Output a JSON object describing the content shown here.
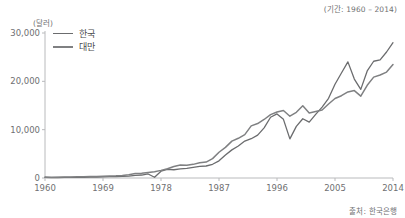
{
  "annotations": {
    "period": "(기간: 1960 – 2014)",
    "source": "출처: 한국은행",
    "unit": "(달러)"
  },
  "legend": {
    "items": [
      {
        "label": "한국",
        "color": "#6b6c6e"
      },
      {
        "label": "대만",
        "color": "#7f8082"
      }
    ]
  },
  "axis": {
    "y_ticks": [
      "0",
      "10,000",
      "20,000",
      "30,000"
    ],
    "x_ticks": [
      "1960",
      "1969",
      "1978",
      "1987",
      "1996",
      "2005",
      "2014"
    ]
  },
  "chart_data": {
    "type": "line",
    "title": "",
    "subtitle": "",
    "xlabel": "",
    "ylabel": "(달러)",
    "xlim": [
      1960,
      2014
    ],
    "ylim": [
      0,
      30000
    ],
    "grid": false,
    "legend_position": "top-left",
    "x": [
      1960,
      1961,
      1962,
      1963,
      1964,
      1965,
      1966,
      1967,
      1968,
      1969,
      1970,
      1971,
      1972,
      1973,
      1974,
      1975,
      1976,
      1977,
      1978,
      1979,
      1980,
      1981,
      1982,
      1983,
      1984,
      1985,
      1986,
      1987,
      1988,
      1989,
      1990,
      1991,
      1992,
      1993,
      1994,
      1995,
      1996,
      1997,
      1998,
      1999,
      2000,
      2001,
      2002,
      2003,
      2004,
      2005,
      2006,
      2007,
      2008,
      2009,
      2010,
      2011,
      2012,
      2013,
      2014
    ],
    "series": [
      {
        "name": "한국",
        "color": "#6b6c6e",
        "values": [
          158,
          94,
          106,
          146,
          124,
          109,
          133,
          161,
          198,
          243,
          279,
          301,
          324,
          406,
          563,
          617,
          834,
          150,
          1400,
          1784,
          1704,
          1883,
          1997,
          2199,
          2413,
          2482,
          2835,
          3555,
          4748,
          5818,
          6610,
          7637,
          8126,
          8885,
          10385,
          12565,
          13254,
          12131,
          8085,
          10672,
          12257,
          11561,
          13165,
          14673,
          16496,
          19403,
          21727,
          24027,
          20475,
          18339,
          22151,
          24156,
          24454,
          26070,
          27990
        ]
      },
      {
        "name": "대만",
        "color": "#7f8082",
        "values": [
          163,
          156,
          170,
          187,
          213,
          233,
          253,
          287,
          322,
          361,
          397,
          447,
          530,
          695,
          920,
          964,
          1132,
          1301,
          1577,
          1920,
          2367,
          2669,
          2653,
          2823,
          3167,
          3297,
          4007,
          5325,
          6338,
          7626,
          8216,
          8982,
          10778,
          11264,
          12107,
          13119,
          13650,
          13967,
          12788,
          13585,
          14941,
          13448,
          13750,
          14066,
          15317,
          16456,
          17026,
          17814,
          18081,
          16933,
          19181,
          20866,
          21308,
          21916,
          23480
        ]
      }
    ]
  }
}
